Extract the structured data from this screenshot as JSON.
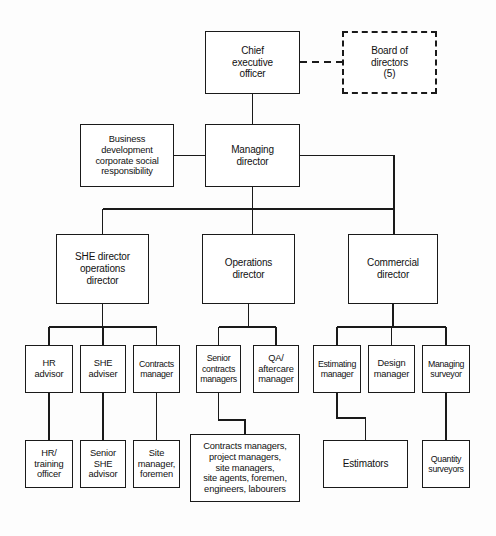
{
  "chart": {
    "type": "org-chart",
    "nodes": [
      {
        "id": "ceo",
        "label": "Chief\nexecutive\nofficer",
        "x": 205,
        "y": 31,
        "w": 95,
        "h": 63,
        "style": "solid"
      },
      {
        "id": "board",
        "label": "Board of\ndirectors\n(5)",
        "x": 342,
        "y": 31,
        "w": 95,
        "h": 63,
        "style": "dashed"
      },
      {
        "id": "md",
        "label": "Managing\ndirector",
        "x": 205,
        "y": 124,
        "w": 95,
        "h": 63,
        "style": "solid"
      },
      {
        "id": "bizdev",
        "label": "Business\ndevelopment\ncorporate social\nresponsibility",
        "x": 80,
        "y": 124,
        "w": 94,
        "h": 63,
        "style": "solid"
      },
      {
        "id": "she-dir",
        "label": "SHE director\noperations\ndirector",
        "x": 56,
        "y": 234,
        "w": 93,
        "h": 70,
        "style": "solid"
      },
      {
        "id": "ops-dir",
        "label": "Operations\ndirector",
        "x": 202,
        "y": 234,
        "w": 93,
        "h": 70,
        "style": "solid"
      },
      {
        "id": "comm-dir",
        "label": "Commercial\ndirector",
        "x": 348,
        "y": 234,
        "w": 90,
        "h": 70,
        "style": "solid"
      },
      {
        "id": "hr-advisor",
        "label": "HR\nadvisor",
        "x": 25,
        "y": 345,
        "w": 48,
        "h": 48,
        "style": "solid"
      },
      {
        "id": "she-adviser",
        "label": "SHE\nadviser",
        "x": 80,
        "y": 345,
        "w": 46,
        "h": 48,
        "style": "solid"
      },
      {
        "id": "contracts-mgr",
        "label": "Contracts\nmanager",
        "x": 133,
        "y": 345,
        "w": 47,
        "h": 48,
        "style": "solid"
      },
      {
        "id": "senior-contracts",
        "label": "Senior\ncontracts\nmanagers",
        "x": 196,
        "y": 345,
        "w": 45,
        "h": 48,
        "style": "solid"
      },
      {
        "id": "qa-aftercare",
        "label": "QA/\naftercare\nmanager",
        "x": 253,
        "y": 345,
        "w": 46,
        "h": 48,
        "style": "solid"
      },
      {
        "id": "estimating-mgr",
        "label": "Estimating\nmanager",
        "x": 313,
        "y": 345,
        "w": 48,
        "h": 48,
        "style": "solid"
      },
      {
        "id": "design-mgr",
        "label": "Design\nmanager",
        "x": 368,
        "y": 345,
        "w": 47,
        "h": 48,
        "style": "solid"
      },
      {
        "id": "managing-surv",
        "label": "Managing\nsurveyor",
        "x": 422,
        "y": 345,
        "w": 48,
        "h": 48,
        "style": "solid"
      },
      {
        "id": "hr-training",
        "label": "HR/\ntraining\nofficer",
        "x": 25,
        "y": 440,
        "w": 48,
        "h": 48,
        "style": "solid"
      },
      {
        "id": "senior-she",
        "label": "Senior\nSHE\nadvisor",
        "x": 80,
        "y": 440,
        "w": 46,
        "h": 48,
        "style": "solid"
      },
      {
        "id": "site-manager",
        "label": "Site\nmanager,\nforemen",
        "x": 133,
        "y": 440,
        "w": 47,
        "h": 48,
        "style": "solid"
      },
      {
        "id": "site-staff",
        "label": "Contracts managers,\nproject managers,\nsite managers,\nsite agents, foremen,\nengineers, labourers",
        "x": 190,
        "y": 434,
        "w": 110,
        "h": 68,
        "style": "solid"
      },
      {
        "id": "estimators",
        "label": "Estimators",
        "x": 323,
        "y": 440,
        "w": 85,
        "h": 48,
        "style": "solid"
      },
      {
        "id": "quantity-surv",
        "label": "Quantity\nsurveyors",
        "x": 422,
        "y": 440,
        "w": 48,
        "h": 48,
        "style": "solid"
      }
    ],
    "edges": [
      {
        "from": "ceo",
        "to": "board",
        "style": "dashed"
      },
      {
        "from": "ceo",
        "to": "md",
        "style": "solid"
      },
      {
        "from": "bizdev",
        "to": "md",
        "style": "solid"
      },
      {
        "from": "md",
        "to": "she-dir",
        "style": "solid"
      },
      {
        "from": "md",
        "to": "ops-dir",
        "style": "solid"
      },
      {
        "from": "md",
        "to": "comm-dir",
        "style": "solid"
      },
      {
        "from": "she-dir",
        "to": "hr-advisor",
        "style": "solid"
      },
      {
        "from": "she-dir",
        "to": "she-adviser",
        "style": "solid"
      },
      {
        "from": "she-dir",
        "to": "contracts-mgr",
        "style": "solid"
      },
      {
        "from": "ops-dir",
        "to": "senior-contracts",
        "style": "solid"
      },
      {
        "from": "ops-dir",
        "to": "qa-aftercare",
        "style": "solid"
      },
      {
        "from": "comm-dir",
        "to": "estimating-mgr",
        "style": "solid"
      },
      {
        "from": "comm-dir",
        "to": "design-mgr",
        "style": "solid"
      },
      {
        "from": "comm-dir",
        "to": "managing-surv",
        "style": "solid"
      },
      {
        "from": "hr-advisor",
        "to": "hr-training",
        "style": "solid"
      },
      {
        "from": "she-adviser",
        "to": "senior-she",
        "style": "solid"
      },
      {
        "from": "contracts-mgr",
        "to": "site-manager",
        "style": "solid"
      },
      {
        "from": "senior-contracts",
        "to": "site-staff",
        "style": "solid"
      },
      {
        "from": "estimating-mgr",
        "to": "estimators",
        "style": "solid"
      },
      {
        "from": "managing-surv",
        "to": "quantity-surv",
        "style": "solid"
      }
    ],
    "colors": {
      "line": "#1a1a1a",
      "box_fill": "#ffffff",
      "text": "#111111",
      "background": "#fdfdfd"
    }
  },
  "caption": {
    "text": ""
  }
}
